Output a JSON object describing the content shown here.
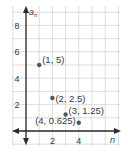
{
  "chart_data": {
    "type": "scatter",
    "title": "",
    "xlabel": "n",
    "ylabel": "a_n",
    "xlim": [
      -0.5,
      7.2
    ],
    "ylim": [
      -1,
      9.5
    ],
    "grid": true,
    "legend": "none",
    "x_ticks": [
      2,
      4
    ],
    "y_ticks": [
      2,
      4,
      6,
      8
    ],
    "points": [
      {
        "x": 1,
        "y": 5,
        "label": "(1, 5)"
      },
      {
        "x": 2,
        "y": 2.5,
        "label": "(2, 2.5)"
      },
      {
        "x": 3,
        "y": 1.25,
        "label": "(3, 1.25)"
      },
      {
        "x": 4,
        "y": 0.625,
        "label": "(4, 0.625)"
      }
    ]
  },
  "colors": {
    "grid": "#d4d4d4",
    "axis": "#2b2b2b",
    "point": "#555555",
    "text": "#3a3a3a"
  }
}
